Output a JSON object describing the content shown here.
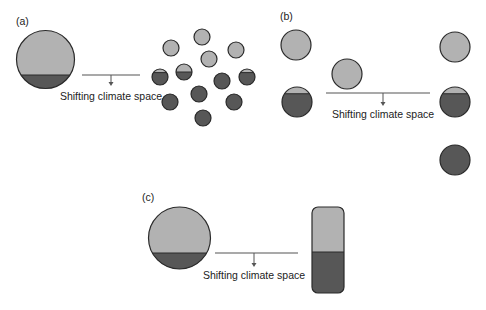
{
  "colors": {
    "light": "#b2b2b2",
    "dark": "#575757",
    "outline": "#2a2a2a",
    "line": "#555555"
  },
  "panels": [
    {
      "id": "a",
      "label": "(a)",
      "caption": "Shifting climate space",
      "source_circle": {
        "cx": 45.5,
        "cy": 59.5,
        "r": 29,
        "split_y": 75
      },
      "arrow_line": {
        "x1": 82,
        "x2": 140,
        "y": 75,
        "arrow_x": 111,
        "arrow_to": 86
      },
      "caption_pos": {
        "x": 111,
        "y": 100
      },
      "small_circles": [
        {
          "cx": 171,
          "cy": 48,
          "r": 8,
          "state": "light"
        },
        {
          "cx": 202,
          "cy": 37,
          "r": 8,
          "state": "light"
        },
        {
          "cx": 236,
          "cy": 50,
          "r": 8,
          "state": "light"
        },
        {
          "cx": 209,
          "cy": 59,
          "r": 8,
          "state": "light"
        },
        {
          "cx": 160,
          "cy": 77,
          "r": 8,
          "state": "mostly-dark"
        },
        {
          "cx": 184,
          "cy": 72,
          "r": 8,
          "state": "half"
        },
        {
          "cx": 222,
          "cy": 81,
          "r": 8,
          "state": "dark"
        },
        {
          "cx": 247,
          "cy": 77,
          "r": 8,
          "state": "mostly-dark"
        },
        {
          "cx": 199,
          "cy": 94,
          "r": 8,
          "state": "dark"
        },
        {
          "cx": 170,
          "cy": 102,
          "r": 8,
          "state": "dark"
        },
        {
          "cx": 234,
          "cy": 102,
          "r": 8,
          "state": "dark"
        },
        {
          "cx": 203,
          "cy": 118,
          "r": 8,
          "state": "dark"
        }
      ]
    },
    {
      "id": "b",
      "label": "(b)",
      "caption": "Shifting climate space",
      "left_circles": [
        {
          "cx": 296,
          "cy": 45,
          "r": 15,
          "state": "light"
        },
        {
          "cx": 297,
          "cy": 102,
          "r": 15,
          "state": "mostly-dark"
        }
      ],
      "middle_circle": {
        "cx": 347,
        "cy": 74,
        "r": 15,
        "state": "light"
      },
      "arrow_line": {
        "x1": 326,
        "x2": 430,
        "y": 93,
        "arrow_x": 383,
        "arrow_to": 106
      },
      "caption_pos": {
        "x": 383,
        "y": 118
      },
      "right_circles": [
        {
          "cx": 455,
          "cy": 47,
          "r": 15,
          "state": "light"
        },
        {
          "cx": 455,
          "cy": 102,
          "r": 15,
          "state": "mostly-dark"
        },
        {
          "cx": 455,
          "cy": 160,
          "r": 15,
          "state": "dark"
        }
      ]
    },
    {
      "id": "c",
      "label": "(c)",
      "caption": "Shifting climate space",
      "source_circle": {
        "cx": 179.5,
        "cy": 238,
        "r": 31,
        "split_y": 253
      },
      "arrow_line": {
        "x1": 215,
        "x2": 298,
        "y": 253,
        "arrow_x": 254,
        "arrow_to": 267
      },
      "caption_pos": {
        "x": 254,
        "y": 279
      },
      "bar": {
        "x": 312,
        "y": 207,
        "w": 32,
        "h": 86,
        "split_y": 252
      }
    }
  ]
}
